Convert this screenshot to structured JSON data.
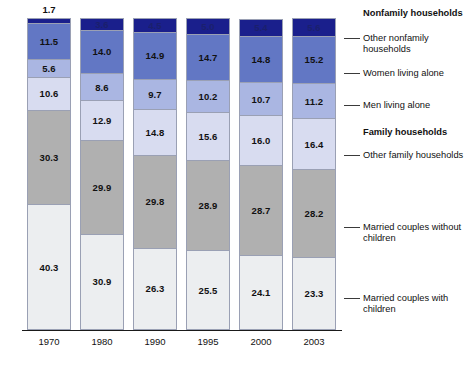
{
  "chart_data": {
    "type": "bar",
    "subtype": "stacked-percentage",
    "title": "",
    "xlabel": "",
    "ylabel": "",
    "ylim": [
      0,
      100
    ],
    "grid": false,
    "legend_position": "right",
    "categories": [
      "1970",
      "1980",
      "1990",
      "1995",
      "2000",
      "2003"
    ],
    "series": [
      {
        "name": "Married couples with children",
        "group": "Family households",
        "color": "#eceef0",
        "values": [
          40.3,
          30.9,
          26.3,
          25.5,
          24.1,
          23.3
        ]
      },
      {
        "name": "Married couples without children",
        "group": "Family households",
        "color": "#b0b0b0",
        "values": [
          30.3,
          29.9,
          29.8,
          28.9,
          28.7,
          28.2
        ]
      },
      {
        "name": "Other family households",
        "group": "Family households",
        "color": "#d8dcf0",
        "values": [
          10.6,
          12.9,
          14.8,
          15.6,
          16.0,
          16.4
        ]
      },
      {
        "name": "Men living alone",
        "group": "Nonfamily households",
        "color": "#aab6e2",
        "values": [
          5.6,
          8.6,
          9.7,
          10.2,
          10.7,
          11.2
        ]
      },
      {
        "name": "Women living alone",
        "group": "Nonfamily households",
        "color": "#6277c4",
        "values": [
          11.5,
          14.0,
          14.9,
          14.7,
          14.8,
          15.2
        ]
      },
      {
        "name": "Other nonfamily households",
        "group": "Nonfamily households",
        "color": "#1a1f8c",
        "values": [
          1.7,
          3.6,
          4.5,
          5.0,
          5.4,
          5.6
        ]
      }
    ]
  },
  "legend": {
    "groups": [
      {
        "label": "Nonfamily households",
        "is_header": true
      },
      {
        "label": "Other nonfamily households",
        "is_header": false
      },
      {
        "label": "Women living alone",
        "is_header": false
      },
      {
        "label": "Men living alone",
        "is_header": false
      },
      {
        "label": "Family households",
        "is_header": true
      },
      {
        "label": "Other family households",
        "is_header": false
      },
      {
        "label": "Married couples without children",
        "is_header": false
      },
      {
        "label": "Married couples with children",
        "is_header": false
      }
    ]
  },
  "colors": {
    "other_nonfamily": "#1a1f8c",
    "women_alone": "#6277c4",
    "men_alone": "#aab6e2",
    "other_family": "#d8dcf0",
    "married_no_children": "#b0b0b0",
    "married_with_children": "#eceef0",
    "axis": "#1a1a1a",
    "segment_border": "#9aa0b4"
  }
}
